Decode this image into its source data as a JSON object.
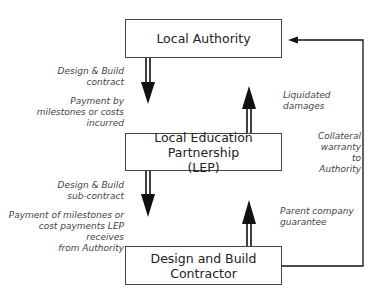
{
  "diagram": {
    "nodes": {
      "authority": {
        "label": "Local Authority"
      },
      "lep": {
        "line1": "Local Education Partnership",
        "line2": "(LEP)"
      },
      "contractor": {
        "label": "Design and Build Contractor"
      }
    },
    "edges": {
      "authority_to_lep": {
        "line1": "Design & Build",
        "line2": "contract"
      },
      "payment_by_milestones": {
        "line1": "Payment by",
        "line2": "milestones or costs",
        "line3": "incurred"
      },
      "lep_to_authority": {
        "line1": "Liquidated",
        "line2": "damages"
      },
      "lep_to_contractor": {
        "line1": "Design & Build",
        "line2": "sub-contract"
      },
      "payment_of_milestones": {
        "line1": "Payment of milestones or",
        "line2": "cost payments LEP receives",
        "line3": "from Authority"
      },
      "contractor_to_lep": {
        "line1": "Parent company",
        "line2": "guarantee"
      },
      "contractor_to_authority": {
        "line1": "Collateral",
        "line2": "warranty",
        "line3": "to",
        "line4": "Authority"
      }
    },
    "colors": {
      "line": "#111111",
      "text": "#222222",
      "label": "#444444"
    }
  }
}
